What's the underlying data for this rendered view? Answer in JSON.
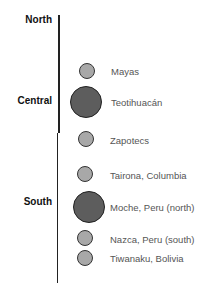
{
  "regions": {
    "north": "North",
    "central": "Central",
    "south": "South"
  },
  "cultures": [
    {
      "name": "Mayas",
      "size": "small",
      "region": "Central"
    },
    {
      "name": "Teotihuacán",
      "size": "large",
      "region": "Central"
    },
    {
      "name": "Zapotecs",
      "size": "small",
      "region": "Central"
    },
    {
      "name": "Tairona, Columbia",
      "size": "small",
      "region": "South"
    },
    {
      "name": "Moche, Peru (north)",
      "size": "large",
      "region": "South"
    },
    {
      "name": "Nazca, Peru (south)",
      "size": "small",
      "region": "South"
    },
    {
      "name": "Tiwanaku, Bolivia",
      "size": "small",
      "region": "South"
    }
  ],
  "colors": {
    "small_dot": "#a8a8a8",
    "large_dot": "#5d5d5d",
    "axis": "#222222",
    "label": "#555555"
  }
}
